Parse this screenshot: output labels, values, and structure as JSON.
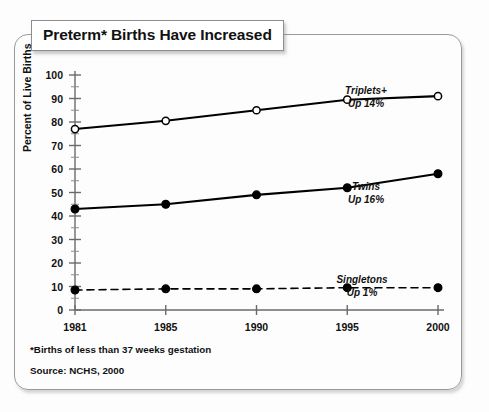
{
  "figure": {
    "title": "Preterm* Births Have Increased",
    "footnote": "*Births of less than 37 weeks gestation",
    "source": "Source: NCHS, 2000"
  },
  "chart_data": {
    "type": "line",
    "title": "Preterm* Births Have Increased",
    "xlabel": "",
    "ylabel": "Percent of Live Births",
    "categories": [
      "1981",
      "1985",
      "1990",
      "1995",
      "2000"
    ],
    "x": [
      1981,
      1985,
      1990,
      1995,
      2000
    ],
    "ylim": [
      0,
      100
    ],
    "yticks": [
      0,
      10,
      20,
      30,
      40,
      50,
      60,
      70,
      80,
      90,
      100
    ],
    "yminor_step": 5,
    "grid": false,
    "legend_position": "inline-annotations",
    "series": [
      {
        "name": "Triplets+",
        "annotation_line1": "Triplets+",
        "annotation_line2": "Up 14%",
        "marker": "open-circle",
        "linestyle": "solid",
        "color": "#000000",
        "values": [
          77,
          80.5,
          85,
          89.5,
          91
        ]
      },
      {
        "name": "Twins",
        "annotation_line1": "Twins",
        "annotation_line2": "Up 16%",
        "marker": "filled-circle",
        "linestyle": "solid",
        "color": "#000000",
        "values": [
          43,
          45,
          49,
          52,
          58
        ]
      },
      {
        "name": "Singletons",
        "annotation_line1": "Singletons",
        "annotation_line2": "Up 1%",
        "marker": "filled-circle",
        "linestyle": "dashed",
        "color": "#000000",
        "values": [
          8.5,
          9,
          9,
          9.5,
          9.5
        ]
      }
    ],
    "annotations": [
      {
        "text": "Triplets+",
        "series": "Triplets+"
      },
      {
        "text": "Up 14%",
        "series": "Triplets+"
      },
      {
        "text": "Twins",
        "series": "Twins"
      },
      {
        "text": "Up 16%",
        "series": "Twins"
      },
      {
        "text": "Singletons",
        "series": "Singletons"
      },
      {
        "text": "Up 1%",
        "series": "Singletons"
      }
    ]
  },
  "colors": {
    "frame": "#9a9a9a",
    "ink": "#111111",
    "axis": "#555555",
    "background": "#fdfdfd"
  }
}
